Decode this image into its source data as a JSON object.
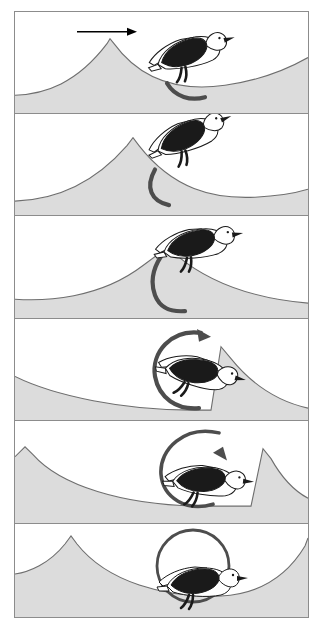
{
  "figure": {
    "type": "illustration-sequence",
    "panel_count": 6,
    "outer_border_color": "#8c8c8c",
    "background_color": "#ffffff",
    "terrain_fill_color": "#dcdcdc",
    "terrain_line_color": "#6e6e6e",
    "arrow_color": "#4d4d4d",
    "bird_dark_color": "#1a1a1a",
    "bird_light_color": "#ffffff",
    "bird_outline_color": "#1a1a1a",
    "direction_arrow_color": "#000000"
  },
  "panels": [
    {
      "index": 1,
      "label": "panel-1",
      "caption": "Wave crest left of bird; short arc begins beneath tail",
      "has_direction_arrow": true,
      "direction_arrow_label": "wave travel direction",
      "rotation_degrees": 55,
      "arc_has_arrowhead": false,
      "bird_rotation_degrees": -14,
      "terrain_peak_x": 105,
      "bird_x": 168,
      "bird_y": 62
    },
    {
      "index": 2,
      "label": "panel-2",
      "caption": "Crest moved right; arc lengthens below bird",
      "has_direction_arrow": false,
      "rotation_degrees": 100,
      "arc_has_arrowhead": false,
      "bird_rotation_degrees": -20,
      "terrain_peak_x": 133,
      "bird_x": 168,
      "bird_y": 52
    },
    {
      "index": 3,
      "label": "panel-3",
      "caption": "Bird atop crest; arc sweeps up past the wing with arrowhead",
      "has_direction_arrow": false,
      "rotation_degrees": 190,
      "arc_has_arrowhead": true,
      "bird_rotation_degrees": -8,
      "terrain_peak_x": 168,
      "bird_x": 172,
      "bird_y": 46
    },
    {
      "index": 4,
      "label": "panel-4",
      "caption": "Crest to the right of bird; arc nearly a full circle",
      "has_direction_arrow": false,
      "rotation_degrees": 300,
      "arc_has_arrowhead": true,
      "bird_rotation_degrees": 14,
      "terrain_peak_x": 206,
      "bird_x": 176,
      "bird_y": 52
    },
    {
      "index": 5,
      "label": "panel-5",
      "caption": "Bird on rising face of next wave; circle closes",
      "has_direction_arrow": false,
      "rotation_degrees": 340,
      "arc_has_arrowhead": true,
      "bird_rotation_degrees": 6,
      "terrain_peak_x": 246,
      "bird_x": 184,
      "bird_y": 60
    },
    {
      "index": 6,
      "label": "panel-6",
      "caption": "Bird in the trough; rotation circle complete",
      "has_direction_arrow": false,
      "rotation_degrees": 360,
      "arc_has_arrowhead": false,
      "bird_rotation_degrees": 0,
      "terrain_peak_x": 300,
      "bird_x": 180,
      "bird_y": 70
    }
  ]
}
